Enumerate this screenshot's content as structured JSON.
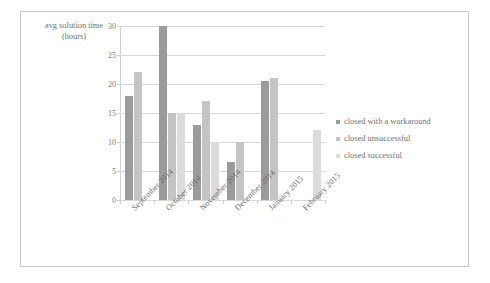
{
  "chart_data": {
    "type": "bar",
    "title": "",
    "subtitle": "",
    "xlabel": "",
    "ylabel": "avg solution time (hours)",
    "ylabel_lines": [
      "avg solution time",
      "(hours)"
    ],
    "ylim": [
      0,
      30
    ],
    "ytick_step": 5,
    "ytick_labels": [
      "30",
      "25",
      "20",
      "15",
      "10",
      "5",
      "0"
    ],
    "ytick_values": [
      30,
      25,
      20,
      15,
      10,
      5,
      0
    ],
    "grid": true,
    "legend_position": "right",
    "categories": [
      "September 2014",
      "October 2014",
      "November 2014",
      "December 2014",
      "January 2015",
      "February 2015"
    ],
    "series": [
      {
        "name": "closed with a workaround",
        "color": "#9b9b9b",
        "values": [
          18,
          30,
          13,
          6.5,
          20.5,
          0
        ]
      },
      {
        "name": "closed unsuccessful",
        "color": "#c4c4c4",
        "values": [
          22,
          15,
          17,
          10,
          21,
          0
        ]
      },
      {
        "name": "closed successful",
        "color": "#dcdcdc",
        "values": [
          0,
          15,
          10,
          0,
          0,
          12
        ]
      }
    ]
  },
  "legend": {
    "items": [
      {
        "label": "closed with a workaround",
        "color": "#9b9b9b"
      },
      {
        "label": "closed unsuccessful",
        "color": "#c4c4c4"
      },
      {
        "label": "closed successful",
        "color": "#dcdcdc"
      }
    ]
  },
  "colors": {
    "gridline": "#d8d8d8",
    "axis": "#cfcfcf",
    "text": "#6f6f6f",
    "frame": "#c9c9c9",
    "background": "#ffffff"
  }
}
